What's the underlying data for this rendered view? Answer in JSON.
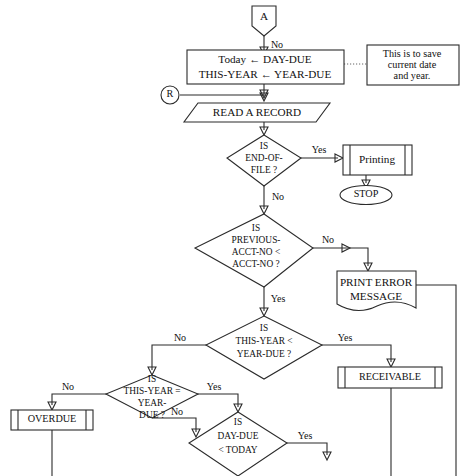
{
  "diagram": {
    "type": "flowchart",
    "background_color": "#ffffff",
    "line_color": "#2b2b2b",
    "text_color": "#111111"
  },
  "nodes": {
    "connector_a": {
      "label": "A",
      "shape": "off-page-connector"
    },
    "connector_r": {
      "label": "R",
      "shape": "circle-connector"
    },
    "process_save": {
      "line1": "Today ← DAY-DUE",
      "line2": "THIS-YEAR ← YEAR-DUE",
      "shape": "process"
    },
    "annotation_save": {
      "line1": "This is to save",
      "line2": "current date",
      "line3": "and year.",
      "shape": "annotation"
    },
    "io_read": {
      "label": "READ A RECORD",
      "shape": "input-output"
    },
    "decision_eof": {
      "line1": "IS",
      "line2": "END-OF-",
      "line3": "FILE ?",
      "shape": "decision"
    },
    "predefined_printing": {
      "label": "Printing",
      "shape": "predefined-process"
    },
    "terminal_stop": {
      "label": "STOP",
      "shape": "terminator"
    },
    "decision_acct": {
      "line1": "IS",
      "line2": "PREVIOUS-",
      "line3": "ACCT-NO <",
      "line4": "ACCT-NO ?",
      "shape": "decision"
    },
    "document_error": {
      "line1": "PRINT ERROR",
      "line2": "MESSAGE",
      "shape": "document"
    },
    "decision_year_lt": {
      "line1": "IS",
      "line2": "THIS-YEAR <",
      "line3": "YEAR-DUE ?",
      "shape": "decision"
    },
    "predefined_receivable": {
      "label": "RECEIVABLE",
      "shape": "predefined-process"
    },
    "decision_year_eq": {
      "line1": "IS",
      "line2": "THIS-YEAR =",
      "line3": "YEAR-",
      "line4": "DUE ?",
      "shape": "decision"
    },
    "predefined_overdue": {
      "label": "OVERDUE",
      "shape": "predefined-process"
    },
    "decision_day_due": {
      "line1": "IS",
      "line2": "DAY-DUE",
      "line3": "< TODAY",
      "shape": "decision"
    }
  },
  "edge_labels": {
    "a_to_save": "No",
    "eof_yes": "Yes",
    "eof_no": "No",
    "acct_no": "No",
    "acct_yes": "Yes",
    "year_lt_yes": "Yes",
    "year_lt_no": "No",
    "year_eq_yes": "Yes",
    "year_eq_no": "No",
    "overdue_no": "No",
    "day_due_yes": "Yes"
  }
}
